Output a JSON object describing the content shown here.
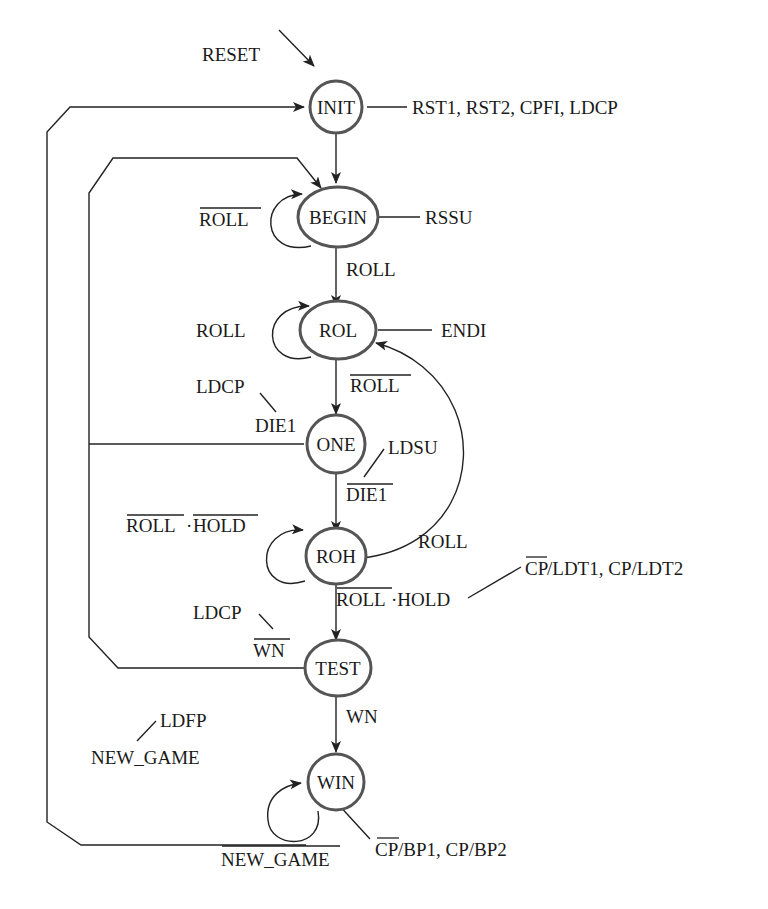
{
  "diagram": {
    "type": "state-machine",
    "title": "",
    "states": [
      {
        "id": "INIT",
        "label": "INIT",
        "outputs": "RST1, RST2, CPFI, LDCP"
      },
      {
        "id": "BEGIN",
        "label": "BEGIN",
        "outputs": "RSSU"
      },
      {
        "id": "ROL",
        "label": "ROL",
        "outputs": "ENDI"
      },
      {
        "id": "ONE",
        "label": "ONE",
        "outputs": ""
      },
      {
        "id": "ROH",
        "label": "ROH",
        "outputs": ""
      },
      {
        "id": "TEST",
        "label": "TEST",
        "outputs": ""
      },
      {
        "id": "WIN",
        "label": "WIN",
        "outputs": "CP/BP1, CP/BP2"
      }
    ],
    "labels": {
      "reset": "RESET",
      "init_out": "RST1, RST2, CPFI, LDCP",
      "begin_self": "ROLL",
      "begin_out": "RSSU",
      "begin_to_rol": "ROLL",
      "rol_self": "ROLL",
      "rol_out": "ENDI",
      "rol_to_one": "ROLL",
      "one_ldcp": "LDCP",
      "one_die1": "DIE1",
      "one_ldsu": "LDSU",
      "one_to_roh": "DIE1",
      "roh_self_a": "ROLL",
      "roh_self_dot": "·",
      "roh_self_b": "HOLD",
      "roh_to_rol": "ROLL",
      "roh_to_test_a": "ROLL",
      "roh_to_test_b": "·HOLD",
      "roh_to_test_out_a": "CP",
      "roh_to_test_out_b": "/LDT1, CP/LDT2",
      "test_ldcp": "LDCP",
      "test_wn_bar": "WN",
      "test_to_win": "WN",
      "win_ldfp": "LDFP",
      "win_new_game": "NEW_GAME",
      "win_self": "NEW_GAME",
      "win_out_a": "CP",
      "win_out_b": "/BP1, CP/BP2"
    },
    "transitions": [
      {
        "from": "RESET",
        "to": "INIT",
        "condition": "RESET"
      },
      {
        "from": "INIT",
        "to": "BEGIN",
        "condition": ""
      },
      {
        "from": "BEGIN",
        "to": "BEGIN",
        "condition": "NOT ROLL"
      },
      {
        "from": "BEGIN",
        "to": "ROL",
        "condition": "ROLL"
      },
      {
        "from": "ROL",
        "to": "ROL",
        "condition": "ROLL"
      },
      {
        "from": "ROL",
        "to": "ONE",
        "condition": "NOT ROLL"
      },
      {
        "from": "ONE",
        "to": "BEGIN",
        "condition": "DIE1",
        "output": "LDCP"
      },
      {
        "from": "ONE",
        "to": "ROH",
        "condition": "NOT DIE1",
        "output": "LDSU"
      },
      {
        "from": "ROH",
        "to": "ROH",
        "condition": "NOT ROLL · NOT HOLD"
      },
      {
        "from": "ROH",
        "to": "ROL",
        "condition": "ROLL"
      },
      {
        "from": "ROH",
        "to": "TEST",
        "condition": "NOT ROLL · HOLD",
        "output": "NOT CP/LDT1, CP/LDT2"
      },
      {
        "from": "TEST",
        "to": "BEGIN",
        "condition": "NOT WN",
        "output": "LDCP"
      },
      {
        "from": "TEST",
        "to": "WIN",
        "condition": "WN"
      },
      {
        "from": "WIN",
        "to": "WIN",
        "condition": "NOT NEW_GAME"
      },
      {
        "from": "WIN",
        "to": "INIT",
        "condition": "NEW_GAME",
        "output": "LDFP"
      }
    ]
  }
}
